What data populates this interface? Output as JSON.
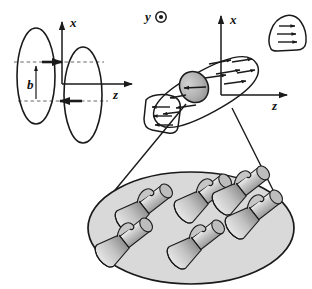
{
  "figure": {
    "background_color": "#ffffff",
    "stroke_color": "#1a1a1a",
    "fill_gray": "#c9c9c9",
    "fill_gray_light": "#d8d8d8",
    "fill_gray_dark": "#a8a8a8"
  },
  "left_panel": {
    "name": "collision-geometry-panel",
    "axes": {
      "x_label": "x",
      "z_label": "z"
    },
    "impact_parameter": {
      "label": "b",
      "arrow": "double-headed-vertical"
    },
    "nuclei": [
      {
        "id": "nucleus-left",
        "shape": "ellipse",
        "cx": 36,
        "cy": 78,
        "rx": 19,
        "ry": 49
      },
      {
        "id": "nucleus-right",
        "shape": "ellipse",
        "cx": 82,
        "cy": 93,
        "rx": 19,
        "ry": 49
      }
    ],
    "momentum_arrows": [
      {
        "id": "arrow-upper",
        "direction": "right",
        "y": 62
      },
      {
        "id": "arrow-lower",
        "direction": "left",
        "y": 101
      }
    ],
    "dashed_guides": [
      62,
      101
    ]
  },
  "out_of_page_axis": {
    "label": "y",
    "glyph": "circle-dot",
    "meaning": "y-axis out of page"
  },
  "right_panel": {
    "name": "overlap-region-panel",
    "axes": {
      "x_label": "x",
      "z_label": "z"
    },
    "overlap_zone": {
      "id": "tilted-lens",
      "description": "tilted almond-shaped participant region",
      "tilt_deg": -28
    },
    "fireball_core": {
      "id": "gray-core-circle",
      "fill": "#b0b0b0"
    },
    "flow_arrows": {
      "upper_group_direction": "right",
      "upper_group_count": 6,
      "lower_group_direction": "left",
      "lower_group_count": 3,
      "core_arrow_direction": "left"
    },
    "spectators": [
      {
        "id": "spectator-right",
        "arrow_direction": "right",
        "arrow_count": 3
      },
      {
        "id": "spectator-left",
        "arrow_direction": "left",
        "arrow_count": 3
      }
    ]
  },
  "zoom_cone": {
    "name": "magnification-cone",
    "line_count": 2,
    "arrowheads": 2
  },
  "bottom_panel": {
    "name": "vorticity-field-ellipse",
    "ellipse_fill": "#d9d9d9",
    "vortex_label": "vortex-bullet",
    "vortex_count": 6,
    "vortices": [
      {
        "id": "vortex-1",
        "cx": 142,
        "cy": 201,
        "rot": -38
      },
      {
        "id": "vortex-2",
        "cx": 125,
        "cy": 235,
        "rot": -38
      },
      {
        "id": "vortex-3",
        "cx": 203,
        "cy": 192,
        "rot": -38
      },
      {
        "id": "vortex-4",
        "cx": 196,
        "cy": 238,
        "rot": -38
      },
      {
        "id": "vortex-5",
        "cx": 253,
        "cy": 206,
        "rot": -38
      },
      {
        "id": "vortex-6",
        "cx": 238,
        "cy": 185,
        "rot": -38
      }
    ]
  }
}
